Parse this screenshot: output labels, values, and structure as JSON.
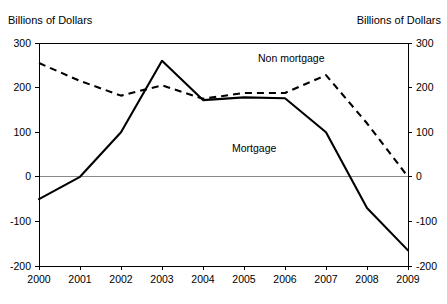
{
  "header": {
    "left_unit_label": "Billions of Dollars",
    "right_unit_label": "Billions of Dollars"
  },
  "chart_data": {
    "type": "line",
    "title": "",
    "xlabel": "",
    "ylabel": "Billions of Dollars",
    "y2label": "Billions of Dollars",
    "categories": [
      "2000",
      "2001",
      "2002",
      "2003",
      "2004",
      "2005",
      "2006",
      "2007",
      "2008",
      "2009"
    ],
    "x": [
      2000,
      2001,
      2002,
      2003,
      2004,
      2005,
      2006,
      2007,
      2008,
      2009
    ],
    "ylim": [
      -200,
      300
    ],
    "yticks": [
      -200,
      -100,
      0,
      100,
      200,
      300
    ],
    "ytick_labels": [
      "-200",
      "-100",
      "0",
      "100",
      "200",
      "300"
    ],
    "y2ticks": [
      -200,
      -100,
      0,
      100,
      200,
      300
    ],
    "y2tick_labels": [
      "-200",
      "-100",
      "0",
      "100",
      "200",
      "300"
    ],
    "grid": false,
    "legend_position": "inline-annotations",
    "series": [
      {
        "name": "Mortgage",
        "style": "solid",
        "label_text": "Mortgage",
        "values": [
          -50,
          0,
          100,
          260,
          172,
          178,
          176,
          100,
          -70,
          -165
        ]
      },
      {
        "name": "Non mortgage",
        "style": "dashed",
        "label_text": "Non mortgage",
        "values": [
          255,
          215,
          182,
          205,
          175,
          188,
          188,
          228,
          120,
          0
        ]
      }
    ]
  }
}
